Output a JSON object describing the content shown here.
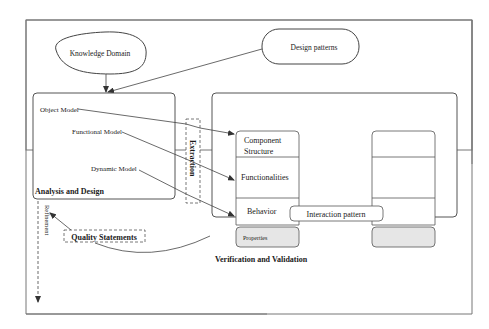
{
  "diagram": {
    "knowledge_domain": "Knowledge Domain",
    "design_patterns": "Design patterns",
    "analysis_design": {
      "title": "Analysis and Design",
      "object_model": "Object Model",
      "functional_model": "Functional Model",
      "dynamic_model": "Dynamic Model"
    },
    "extraction": "Extraction",
    "verification": {
      "title": "Verification and Validation",
      "component_structure_line1": "Component",
      "component_structure_line2": "Structure",
      "functionalities": "Functionalities",
      "behavior": "Behavior",
      "properties": "Properties",
      "interaction_pattern": "Interaction pattern"
    },
    "quality_statements": "Quality Statements",
    "refinement": "Refinement",
    "colors": {
      "line": "#555555",
      "properties_fill": "#e6e6e6",
      "background": "#ffffff"
    }
  }
}
